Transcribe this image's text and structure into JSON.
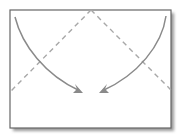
{
  "diagram": {
    "type": "origami-fold-step",
    "colors": {
      "paper": "#ffffff",
      "border": "#666666",
      "shadow": "#9a9a9a",
      "fold_line": "#a8a8a8",
      "arrow": "#8a8a8a"
    },
    "sheet": {
      "x": 10,
      "y": 10,
      "width": 161,
      "height": 118
    },
    "fold_lines": [
      {
        "name": "left-diagonal",
        "from": [
          91,
          10
        ],
        "to": [
          10,
          92
        ],
        "style": "dashed"
      },
      {
        "name": "right-diagonal",
        "from": [
          91,
          10
        ],
        "to": [
          171,
          90
        ],
        "style": "dashed"
      }
    ],
    "arrows": [
      {
        "name": "left-corner-arrow",
        "from": [
          15,
          17
        ],
        "to": [
          82,
          92
        ]
      },
      {
        "name": "right-corner-arrow",
        "from": [
          166,
          16
        ],
        "to": [
          100,
          92
        ]
      }
    ]
  }
}
